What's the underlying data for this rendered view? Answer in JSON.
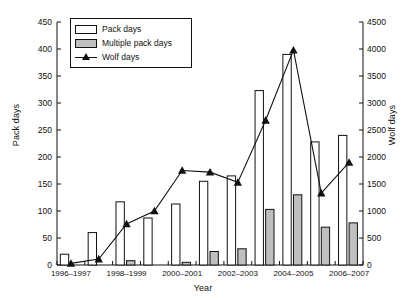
{
  "chart_data": {
    "type": "bar",
    "title": "",
    "xlabel": "Year",
    "ylabel": "Pack days",
    "y2label": "Wolf days",
    "grid": false,
    "legend_position": "top-left",
    "categories": [
      "1996–1997",
      "1997–1998",
      "1998–1999",
      "1999–2000",
      "2000–2001",
      "2001–2002",
      "2002–2003",
      "2003–2004",
      "2004–2005",
      "2005–2006",
      "2006–2007"
    ],
    "xtick_labels": [
      "1996–1997",
      "1998–1999",
      "2000–2001",
      "2002–2003",
      "2004–2005",
      "2006–2007"
    ],
    "ylim": [
      0,
      450
    ],
    "yticks": [
      0,
      50,
      100,
      150,
      200,
      250,
      300,
      350,
      400,
      450
    ],
    "y2lim": [
      0,
      4500
    ],
    "y2ticks": [
      0,
      500,
      1000,
      1500,
      2000,
      2500,
      3000,
      3500,
      4000,
      4500
    ],
    "series": [
      {
        "name": "Pack days",
        "axis": "left",
        "style": "bar-white",
        "color": "#ffffff",
        "edge_color": "#111111",
        "values": [
          20,
          60,
          117,
          87,
          113,
          155,
          165,
          323,
          390,
          228,
          240
        ]
      },
      {
        "name": "Multiple pack days",
        "axis": "left",
        "style": "bar-gray",
        "color": "#bfbfbf",
        "edge_color": "#111111",
        "values": [
          0,
          0,
          8,
          0,
          5,
          25,
          30,
          103,
          130,
          70,
          78
        ]
      },
      {
        "name": "Wolf days",
        "axis": "right",
        "style": "line-marker",
        "color": "#111111",
        "marker": "triangle",
        "values": [
          30,
          110,
          760,
          1000,
          1750,
          1720,
          1530,
          2680,
          3980,
          1330,
          1900
        ]
      }
    ]
  },
  "legend": {
    "items": [
      {
        "label": "Pack days",
        "key": "white-swatch"
      },
      {
        "label": "Multiple pack days",
        "key": "gray-swatch"
      },
      {
        "label": "Wolf days",
        "key": "line-triangle-marker"
      }
    ]
  }
}
